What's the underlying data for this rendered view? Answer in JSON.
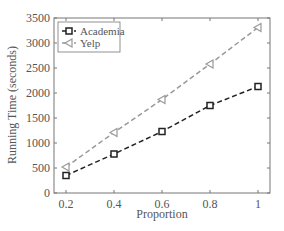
{
  "chart_data": {
    "type": "line",
    "title": "",
    "xlabel": "Proportion",
    "ylabel": "Running Time (seconds)",
    "x": [
      0.2,
      0.4,
      0.6,
      0.8,
      1.0
    ],
    "xticks": [
      "0.2",
      "0.4",
      "0.6",
      "0.8",
      "1"
    ],
    "yticks": [
      "0",
      "500",
      "1000",
      "1500",
      "2000",
      "2500",
      "3000",
      "3500"
    ],
    "xlim": [
      0.15,
      1.05
    ],
    "ylim": [
      0,
      3500
    ],
    "grid": false,
    "legend_position": "upper left",
    "series": [
      {
        "name": "Academia",
        "values": [
          350,
          780,
          1230,
          1750,
          2130
        ],
        "color": "#222222",
        "marker": "square",
        "linestyle": "dashed"
      },
      {
        "name": "Yelp",
        "values": [
          520,
          1210,
          1870,
          2580,
          3310
        ],
        "color": "#999999",
        "marker": "triangle-left",
        "linestyle": "dashed"
      }
    ]
  }
}
